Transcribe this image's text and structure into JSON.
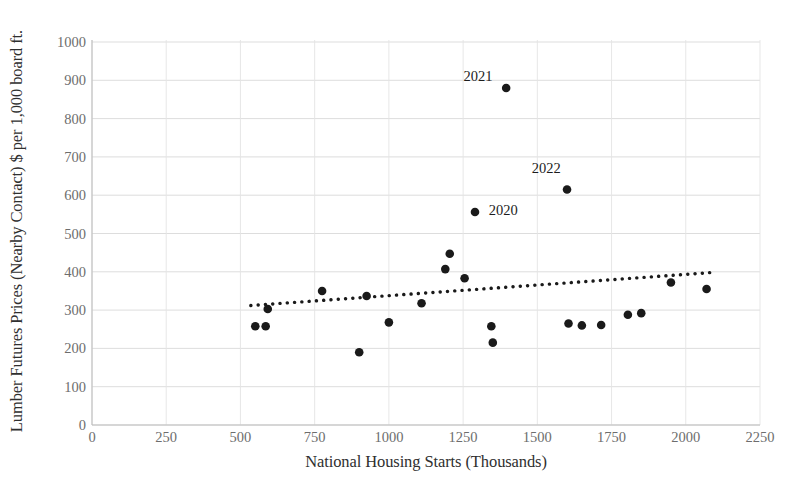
{
  "chart_data": {
    "type": "scatter",
    "title": "",
    "xlabel": "National Housing Starts (Thousands)",
    "ylabel": "Lumber Futures Prices (Nearby Contact) $ per 1,000 board ft.",
    "xlim": [
      0,
      2250
    ],
    "ylim": [
      0,
      1000
    ],
    "xticks": [
      0,
      250,
      500,
      750,
      1000,
      1250,
      1500,
      1750,
      2000,
      2250
    ],
    "yticks": [
      0,
      100,
      200,
      300,
      400,
      500,
      600,
      700,
      800,
      900,
      1000
    ],
    "grid": true,
    "legend": "none",
    "marker_color": "#1a1a1a",
    "trendline_color": "#1a1a1a",
    "gridline_color": "#d9d9d9",
    "points": [
      {
        "x": 550,
        "y": 258,
        "label": ""
      },
      {
        "x": 585,
        "y": 258,
        "label": ""
      },
      {
        "x": 592,
        "y": 303,
        "label": ""
      },
      {
        "x": 775,
        "y": 350,
        "label": ""
      },
      {
        "x": 925,
        "y": 337,
        "label": ""
      },
      {
        "x": 1110,
        "y": 318,
        "label": ""
      },
      {
        "x": 1000,
        "y": 268,
        "label": ""
      },
      {
        "x": 900,
        "y": 190,
        "label": ""
      },
      {
        "x": 1205,
        "y": 447,
        "label": ""
      },
      {
        "x": 1190,
        "y": 407,
        "label": ""
      },
      {
        "x": 1255,
        "y": 383,
        "label": ""
      },
      {
        "x": 1290,
        "y": 556,
        "label": "2020"
      },
      {
        "x": 1345,
        "y": 258,
        "label": ""
      },
      {
        "x": 1350,
        "y": 215,
        "label": ""
      },
      {
        "x": 1395,
        "y": 880,
        "label": "2021"
      },
      {
        "x": 1600,
        "y": 615,
        "label": "2022"
      },
      {
        "x": 1605,
        "y": 265,
        "label": ""
      },
      {
        "x": 1650,
        "y": 260,
        "label": ""
      },
      {
        "x": 1715,
        "y": 261,
        "label": ""
      },
      {
        "x": 1805,
        "y": 288,
        "label": ""
      },
      {
        "x": 1850,
        "y": 292,
        "label": ""
      },
      {
        "x": 1950,
        "y": 372,
        "label": ""
      },
      {
        "x": 2070,
        "y": 355,
        "label": ""
      }
    ],
    "trendline": {
      "x_start": 535,
      "y_start": 312,
      "x_end": 2085,
      "y_end": 398,
      "style": "dotted"
    },
    "annotations": [
      {
        "text": "2021",
        "x": 1300,
        "y": 912
      },
      {
        "text": "2022",
        "x": 1530,
        "y": 672
      },
      {
        "text": "2020",
        "x": 1385,
        "y": 562
      }
    ]
  }
}
